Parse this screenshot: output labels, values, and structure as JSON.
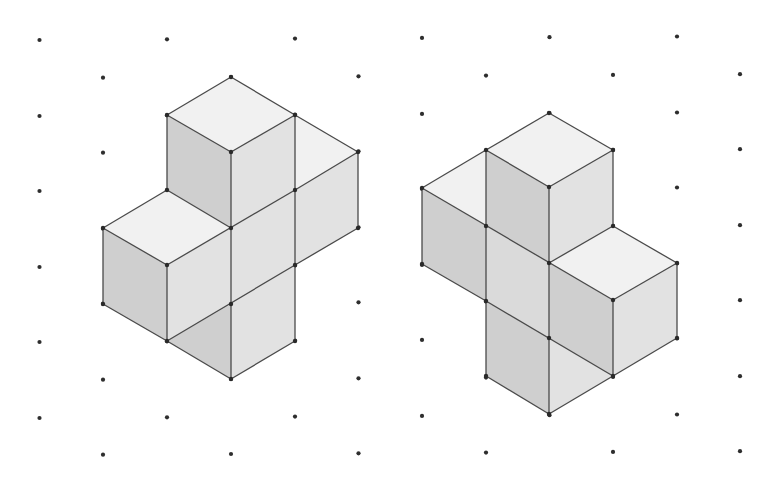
{
  "diagram": {
    "title": "",
    "colors": {
      "background": "#ffffff",
      "grid_dot": "#2e2e2e",
      "edge": "#4a4a4a",
      "top_face": "#f1f1f1",
      "left_face": "#cfcfcf",
      "right_face": "#e2e2e2",
      "mid_face": "#dadada"
    },
    "grid": {
      "type": "isometric-dot",
      "column_x": [
        39.5,
        103,
        167,
        231,
        295,
        358.5,
        422,
        486,
        549.5,
        613,
        677,
        740
      ],
      "even_column_rows_y": [
        40,
        116,
        191,
        267,
        342,
        418
      ],
      "odd_column_rows_y": [
        78,
        153,
        229,
        304,
        380,
        455
      ]
    },
    "figures": [
      {
        "name": "left-solid",
        "faces": [
          {
            "type": "top",
            "points": "231,77 295,115 231,152 167,115"
          },
          {
            "type": "left",
            "points": "167,115 231,152 231,228 167,190"
          },
          {
            "type": "right",
            "points": "231,152 295,115 295,190 231,228"
          },
          {
            "type": "top",
            "points": "295,115 358,152 295,190"
          },
          {
            "type": "right",
            "points": "295,190 358,152 358,228 295,265"
          },
          {
            "type": "top",
            "points": "167,190 231,228 167,265 103,228"
          },
          {
            "type": "left",
            "points": "103,228 167,265 167,341 103,304"
          },
          {
            "type": "right",
            "points": "167,265 231,228 231,304 167,341"
          },
          {
            "type": "right",
            "points": "231,228 295,190 295,265 231,304"
          },
          {
            "type": "left",
            "points": "167,341 231,304 231,379"
          },
          {
            "type": "right",
            "points": "231,304 295,265 295,341 231,379"
          }
        ],
        "edges": [
          "231,77 295,115",
          "231,77 167,115",
          "167,115 231,152",
          "231,152 295,115",
          "167,115 167,190",
          "231,152 231,379",
          "295,115 295,341",
          "295,115 358,152",
          "358,152 295,190",
          "358,152 358,228",
          "358,228 295,265",
          "167,190 231,228",
          "167,190 103,228",
          "103,228 167,265",
          "167,265 295,190",
          "103,228 103,304",
          "103,304 167,341",
          "167,265 167,341",
          "167,341 295,265",
          "167,341 231,379",
          "231,379 295,341"
        ],
        "vertices": [
          "231,77",
          "167,115",
          "295,115",
          "231,152",
          "358,152",
          "167,190",
          "295,190",
          "103,228",
          "231,228",
          "358,228",
          "167,265",
          "295,265",
          "103,304",
          "231,304",
          "167,341",
          "295,341",
          "231,379"
        ]
      },
      {
        "name": "right-solid",
        "faces": [
          {
            "type": "top",
            "points": "549,113 613,150 549,187 486,150"
          },
          {
            "type": "left",
            "points": "486,150 549,187 549,263 486,226"
          },
          {
            "type": "right",
            "points": "549,187 613,150 613,226 549,263"
          },
          {
            "type": "top",
            "points": "422,188 486,150 486,226"
          },
          {
            "type": "left",
            "points": "422,188 486,226 486,301 422,264"
          },
          {
            "type": "mid",
            "points": "486,226 549,263 549,338 486,301"
          },
          {
            "type": "top",
            "points": "549,263 613,226 677,263 613,300"
          },
          {
            "type": "left",
            "points": "549,263 613,300 613,376 549,338"
          },
          {
            "type": "right",
            "points": "613,300 677,263 677,338 613,376"
          },
          {
            "type": "left",
            "points": "486,301 549,338 549,414 486,376"
          },
          {
            "type": "right",
            "points": "549,338 613,376 549,414"
          }
        ],
        "edges": [
          "549,113 613,150",
          "549,113 486,150",
          "486,150 549,187",
          "549,187 613,150",
          "613,150 613,226",
          "549,187 549,414",
          "486,150 486,376",
          "422,188 486,150",
          "422,188 613,300",
          "422,188 422,264",
          "422,264 486,301",
          "486,301 613,376",
          "549,263 613,226",
          "613,226 677,263",
          "677,263 613,300",
          "677,263 677,338",
          "677,338 613,376",
          "613,300 613,376",
          "486,376 549,414",
          "549,414 613,376"
        ],
        "vertices": [
          "549,113",
          "486,150",
          "613,150",
          "422,188",
          "549,187",
          "486,226",
          "613,226",
          "422,264",
          "549,263",
          "677,263",
          "486,301",
          "613,300",
          "549,338",
          "677,338",
          "486,376",
          "613,376",
          "549,414"
        ]
      }
    ]
  }
}
